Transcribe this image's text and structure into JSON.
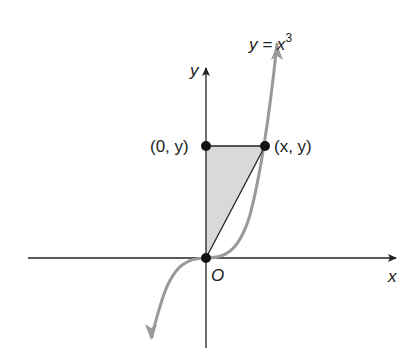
{
  "diagram": {
    "curve_label": {
      "prefix": "y = x",
      "exponent": "3"
    },
    "axes": {
      "x_label": "x",
      "y_label": "y",
      "origin_label": "O"
    },
    "points": [
      {
        "name": "origin",
        "label": ""
      },
      {
        "name": "y-intercept-point",
        "label": "(0, y)"
      },
      {
        "name": "curve-point",
        "label": "(x, y)"
      }
    ],
    "colors": {
      "axis": "#222222",
      "curve": "#9a9a9a",
      "shade": "#d9d9d9",
      "point": "#111111"
    }
  }
}
